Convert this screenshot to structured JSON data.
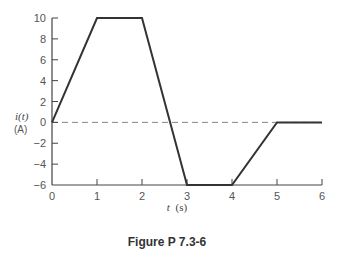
{
  "chart_data": {
    "type": "line",
    "title": "",
    "caption": "Figure P 7.3-6",
    "xlabel_var": "t",
    "xlabel_unit": "(s)",
    "ylabel_var": "i(t)",
    "ylabel_unit": "(A)",
    "xlim": [
      0,
      6
    ],
    "ylim": [
      -6,
      10
    ],
    "xticks": [
      0,
      1,
      2,
      3,
      4,
      5,
      6
    ],
    "yticks": [
      10,
      8,
      6,
      4,
      2,
      0,
      -2,
      -4,
      -6
    ],
    "xtick_labels": [
      "0",
      "1",
      "2",
      "3",
      "4",
      "5",
      "6"
    ],
    "ytick_labels": [
      "10",
      "8",
      "6",
      "4",
      "2",
      "0",
      "−2",
      "−4",
      "−6"
    ],
    "reference_line": {
      "y": 0,
      "style": "dashed"
    },
    "grid": false,
    "series": [
      {
        "name": "i(t)",
        "x": [
          0,
          1,
          2,
          3,
          4,
          5,
          6
        ],
        "y": [
          0,
          10,
          10,
          -6,
          -6,
          0,
          0
        ],
        "color": "#333333"
      }
    ]
  }
}
